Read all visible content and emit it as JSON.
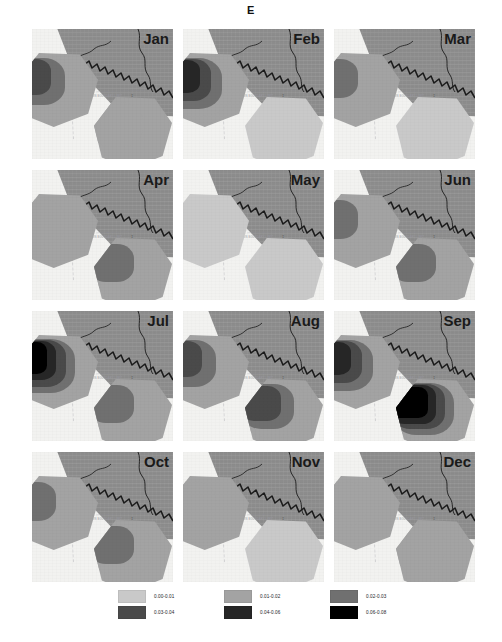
{
  "figure": {
    "letter": "E",
    "place_label": "BASIN BOUNDARY\nLIMIT",
    "marker_glyph": "‡"
  },
  "panels": [
    {
      "month": "Jan"
    },
    {
      "month": "Feb"
    },
    {
      "month": "Mar"
    },
    {
      "month": "Apr"
    },
    {
      "month": "May"
    },
    {
      "month": "Jun"
    },
    {
      "month": "Jul"
    },
    {
      "month": "Aug"
    },
    {
      "month": "Sep"
    },
    {
      "month": "Oct"
    },
    {
      "month": "Nov"
    },
    {
      "month": "Dec"
    }
  ],
  "legend": {
    "classes": [
      {
        "label": "0.00-0.01",
        "color": "#c9c9c9"
      },
      {
        "label": "0.01-0.02",
        "color": "#a3a3a3"
      },
      {
        "label": "0.02-0.03",
        "color": "#707070"
      },
      {
        "label": "0.03-0.04",
        "color": "#4a4a4a"
      },
      {
        "label": "0.04-0.06",
        "color": "#262626"
      },
      {
        "label": "0.06-0.08",
        "color": "#000000"
      }
    ]
  },
  "chart_data": {
    "type": "heatmap",
    "title": "E",
    "xlabel": "",
    "ylabel": "",
    "grid": false,
    "legend_position": "bottom",
    "small_multiples": "3 columns x 4 rows of monthly choropleth maps",
    "categories": [
      "Jan",
      "Feb",
      "Mar",
      "Apr",
      "May",
      "Jun",
      "Jul",
      "Aug",
      "Sep",
      "Oct",
      "Nov",
      "Dec"
    ],
    "class_breaks": [
      0.0,
      0.01,
      0.02,
      0.03,
      0.04,
      0.06,
      0.08
    ],
    "class_labels": [
      "0.00-0.01",
      "0.01-0.02",
      "0.02-0.03",
      "0.03-0.04",
      "0.04-0.06",
      "0.06-0.08"
    ],
    "class_colors": [
      "#c9c9c9",
      "#a3a3a3",
      "#707070",
      "#4a4a4a",
      "#262626",
      "#000000"
    ],
    "regions": [
      "zone-a-upper-left",
      "zone-b-lower-right"
    ],
    "series": [
      {
        "name": "zone-a-upper-left",
        "values": [
          0.035,
          0.055,
          0.025,
          0.015,
          0.005,
          0.025,
          0.065,
          0.035,
          0.045,
          0.025,
          0.015,
          0.015
        ],
        "class_index": [
          3,
          4,
          2,
          1,
          0,
          2,
          5,
          3,
          4,
          2,
          1,
          1
        ]
      },
      {
        "name": "zone-b-lower-right",
        "values": [
          0.015,
          0.005,
          0.005,
          0.025,
          0.005,
          0.025,
          0.025,
          0.035,
          0.065,
          0.025,
          0.005,
          0.015
        ],
        "class_index": [
          1,
          0,
          0,
          2,
          0,
          2,
          2,
          3,
          5,
          2,
          0,
          1
        ]
      }
    ]
  }
}
